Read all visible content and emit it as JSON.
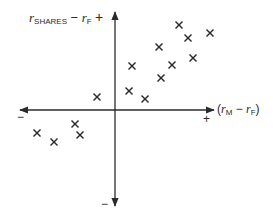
{
  "chart_data": {
    "type": "scatter",
    "title": "",
    "marker": "x",
    "axes": {
      "y_label": {
        "r": "r",
        "sub1": "SHARES",
        "minus": " − ",
        "r2": "r",
        "sub2": "F"
      },
      "x_label": {
        "open": "(",
        "r": "r",
        "sub1": "M",
        "minus": " − ",
        "r2": "r",
        "sub2": "F",
        "close": ")"
      },
      "y_positive_sign": "+",
      "y_negative_sign": "−",
      "x_positive_sign": "+",
      "x_negative_sign": "−"
    },
    "xlabel": "(r_M − r_F)",
    "ylabel": "r_SHARES − r_F",
    "grid": false,
    "origin_centered": true,
    "points": [
      {
        "x": 64,
        "y": 85
      },
      {
        "x": 73,
        "y": 72
      },
      {
        "x": 95,
        "y": 77
      },
      {
        "x": 44,
        "y": 63
      },
      {
        "x": 78,
        "y": 52
      },
      {
        "x": 57,
        "y": 45
      },
      {
        "x": 17,
        "y": 44
      },
      {
        "x": 46,
        "y": 32
      },
      {
        "x": 14,
        "y": 19
      },
      {
        "x": 30,
        "y": 11
      },
      {
        "x": -18,
        "y": 13
      },
      {
        "x": -40,
        "y": -14
      },
      {
        "x": -78,
        "y": -23
      },
      {
        "x": -35,
        "y": -25
      },
      {
        "x": -61,
        "y": -32
      }
    ],
    "pixel_points": [
      [
        179,
        25
      ],
      [
        188,
        38
      ],
      [
        210,
        33
      ],
      [
        159,
        47
      ],
      [
        193,
        58
      ],
      [
        172,
        65
      ],
      [
        132,
        66
      ],
      [
        161,
        78
      ],
      [
        129,
        91
      ],
      [
        145,
        99
      ],
      [
        97,
        97
      ],
      [
        75,
        124
      ],
      [
        37,
        133
      ],
      [
        80,
        135
      ],
      [
        54,
        142
      ]
    ],
    "colors": {
      "ink": "#2a2a2a",
      "background": "#ffffff"
    }
  }
}
